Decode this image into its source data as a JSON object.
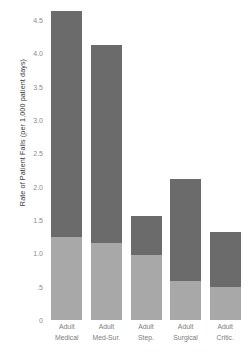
{
  "chart_data": {
    "type": "bar",
    "stacked": true,
    "title": "",
    "subtitle": "",
    "xlabel": "",
    "ylabel": "Rate of Patient Falls (per 1,000 patient days)",
    "ylim": [
      0,
      4.75
    ],
    "grid": false,
    "legend": "none",
    "ytick_labels": [
      "4.5",
      "4.0",
      "3.5",
      "3.0",
      "2.5",
      "2.0",
      "1.5",
      "1.0",
      ".5",
      "0"
    ],
    "ytick_values": [
      4.5,
      4.0,
      3.5,
      3.0,
      2.5,
      2.0,
      1.5,
      1.0,
      0.5,
      0.0
    ],
    "categories": [
      "Adult Medical",
      "Adult Med-Sur.",
      "Adult Step.",
      "Adult Surgical",
      "Adult Critic."
    ],
    "category_lines": [
      [
        "Adult",
        "Medical"
      ],
      [
        "Adult",
        "Med-Sur."
      ],
      [
        "Adult",
        "Step."
      ],
      [
        "Adult",
        "Surgical"
      ],
      [
        "Adult",
        "Critic."
      ]
    ],
    "series": [
      {
        "name": "lower-segment",
        "color": "#a8a8a8",
        "values": [
          1.25,
          1.15,
          0.98,
          0.58,
          0.5
        ]
      },
      {
        "name": "upper-segment",
        "color": "#6b6b6b",
        "values": [
          3.38,
          2.97,
          0.58,
          1.53,
          0.82
        ]
      }
    ],
    "totals": [
      4.63,
      4.12,
      1.56,
      2.11,
      1.32
    ]
  },
  "colors": {
    "segment_dark": "#6b6b6b",
    "segment_light": "#a8a8a8",
    "tick_text": "#8a8a8a",
    "axis_title": "#3a3a3a",
    "background": "#ffffff"
  }
}
